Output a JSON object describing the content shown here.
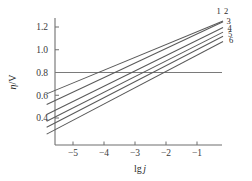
{
  "figure": {
    "name": "tafel-plot",
    "background_color": "#ffffff",
    "line_color": "#5a5a5a",
    "axis_color": "#6f6f6f"
  },
  "chart_data": {
    "type": "line",
    "title": "",
    "subtitle": "",
    "xlabel": "lg j",
    "xlabel_parts": {
      "prefix": "lg",
      "italic": "j"
    },
    "ylabel": "η/V",
    "ylabel_parts": {
      "italic": "η",
      "suffix": "/V"
    },
    "xlim": [
      -5.85,
      -0.12
    ],
    "ylim": [
      0.22,
      1.29
    ],
    "xticks": [
      -5,
      -4,
      -3,
      -2,
      -1
    ],
    "xticklabels": [
      "−5",
      "−4",
      "−3",
      "−2",
      "−1"
    ],
    "yticks": [
      0.4,
      0.6,
      0.8,
      1.0,
      1.2
    ],
    "yticklabels": [
      "0.4",
      "0.6",
      "0.8",
      "1.0",
      "1.2"
    ],
    "grid": false,
    "legend": "inline-right-end-labels",
    "reference_lines": [
      {
        "name": "eta-0.8-horizontal",
        "orientation": "horizontal",
        "value": 0.8
      }
    ],
    "series": [
      {
        "name": "1",
        "label": "1",
        "x": [
          -5.85,
          -0.16
        ],
        "y": [
          0.612,
          1.253
        ]
      },
      {
        "name": "2",
        "label": "2",
        "x": [
          -5.85,
          -0.16
        ],
        "y": [
          0.518,
          1.246
        ]
      },
      {
        "name": "3",
        "label": "3",
        "x": [
          -5.85,
          -0.16
        ],
        "y": [
          0.43,
          1.196
        ]
      },
      {
        "name": "4",
        "label": "4",
        "x": [
          -5.85,
          -0.16
        ],
        "y": [
          0.372,
          1.155
        ]
      },
      {
        "name": "5",
        "label": "5",
        "x": [
          -5.85,
          -0.16
        ],
        "y": [
          0.318,
          1.118
        ]
      },
      {
        "name": "6",
        "label": "6",
        "x": [
          -5.85,
          -0.16
        ],
        "y": [
          0.258,
          1.072
        ]
      }
    ],
    "curve_labels": [
      {
        "text": "1",
        "x": -0.3,
        "y": 1.315
      },
      {
        "text": "2",
        "x": -0.06,
        "y": 1.315
      },
      {
        "text": "3",
        "x": 0.02,
        "y": 1.225
      },
      {
        "text": "4",
        "x": 0.05,
        "y": 1.163
      },
      {
        "text": "5",
        "x": 0.07,
        "y": 1.115
      },
      {
        "text": "6",
        "x": 0.1,
        "y": 1.06
      }
    ]
  }
}
